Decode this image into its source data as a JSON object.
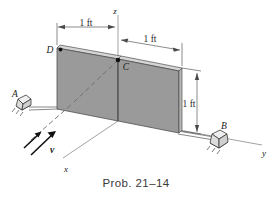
{
  "figure": {
    "caption": "Prob. 21–14",
    "kind": "engineering-mechanics-3d-diagram"
  },
  "axes": {
    "z_label": "z",
    "y_label": "y",
    "x_label": "x"
  },
  "points": {
    "A": "A",
    "B": "B",
    "C": "C",
    "D": "D"
  },
  "dimensions": {
    "left_span": "1 ft",
    "right_span": "1 ft",
    "height": "1 ft"
  },
  "vectors": {
    "velocity_label": "v"
  },
  "colors": {
    "panel_fill": "#9a9a9a",
    "panel_top_edge": "#d5d5d5",
    "panel_side_edge": "#b8b8b8",
    "outline": "#4f4f4f",
    "axis": "#8a8a8a",
    "dimension": "#5a5a5a",
    "background": "#ffffff",
    "text": "#1a1a1a",
    "hinge_fill": "#e2e2e2"
  }
}
